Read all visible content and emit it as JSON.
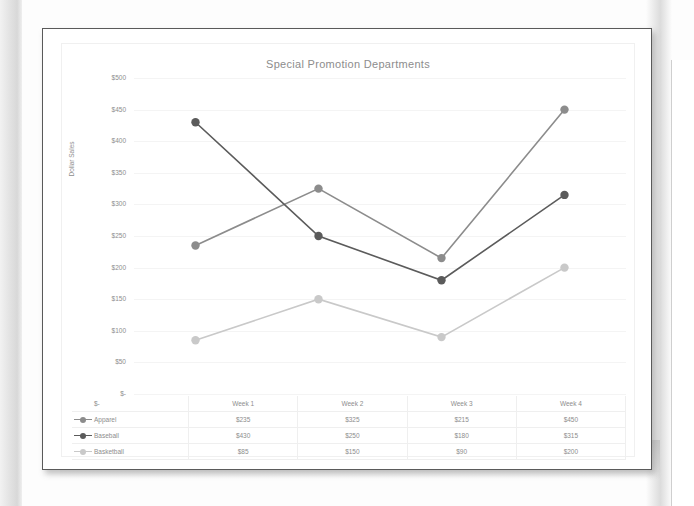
{
  "document": {
    "sheet_label": "scanned-chart-page"
  },
  "chart": {
    "title": "Special Promotion Departments",
    "y_axis_title": "Dollar Sales"
  },
  "chart_data": {
    "type": "line",
    "title": "Special Promotion Departments",
    "xlabel": "",
    "ylabel": "Dollar Sales",
    "categories": [
      "Week 1",
      "Week 2",
      "Week 3",
      "Week 4"
    ],
    "ylim": [
      0,
      500
    ],
    "yticks": [
      0,
      50,
      100,
      150,
      200,
      250,
      300,
      350,
      400,
      450,
      500
    ],
    "ytick_labels": [
      "$-",
      "$50",
      "$100",
      "$150",
      "$200",
      "$250",
      "$300",
      "$350",
      "$400",
      "$450",
      "$500"
    ],
    "grid": true,
    "legend": "data-table",
    "series": [
      {
        "name": "Apparel",
        "color": "#8c8c8c",
        "values": [
          235,
          325,
          215,
          450
        ],
        "labels": [
          "$235",
          "$325",
          "$215",
          "$450"
        ]
      },
      {
        "name": "Baseball",
        "color": "#5b5b5b",
        "values": [
          430,
          250,
          180,
          315
        ],
        "labels": [
          "$430",
          "$250",
          "$180",
          "$315"
        ]
      },
      {
        "name": "Basketball",
        "color": "#c9c9c9",
        "values": [
          85,
          150,
          90,
          200
        ],
        "labels": [
          "$85",
          "$150",
          "$90",
          "$200"
        ]
      }
    ]
  },
  "table": {
    "corner_label": "$-",
    "headers": [
      "Week 1",
      "Week 2",
      "Week 3",
      "Week 4"
    ],
    "rows": [
      {
        "name": "Apparel",
        "cells": [
          "$235",
          "$325",
          "$215",
          "$450"
        ]
      },
      {
        "name": "Baseball",
        "cells": [
          "$430",
          "$250",
          "$180",
          "$315"
        ]
      },
      {
        "name": "Basketball",
        "cells": [
          "$85",
          "$150",
          "$90",
          "$200"
        ]
      }
    ]
  }
}
